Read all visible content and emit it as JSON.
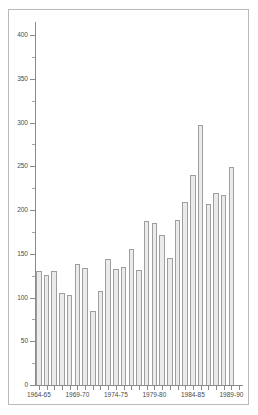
{
  "figure": {
    "background_color": "#ffffff",
    "frame_color": "#b9b9b9",
    "axis_color": "#8a8a8a",
    "bar_fill_color": "#ebebeb",
    "bar_edge_color": "#9e9e9e"
  },
  "chart_data": {
    "type": "bar",
    "title": "",
    "subtitle": "",
    "xlabel": "",
    "ylabel": "",
    "ylim": [
      0,
      415
    ],
    "grid": false,
    "legend": null,
    "y_major_ticks": [
      0,
      50,
      100,
      150,
      200,
      250,
      300,
      350,
      400
    ],
    "y_tick_labels": [
      "0",
      "50",
      "100",
      "150",
      "200",
      "250",
      "300",
      "350",
      "400"
    ],
    "y_minor_tick_interval": 25,
    "x_tick_labels": [
      "1964-65",
      "1969-70",
      "1974-75",
      "1979-80",
      "1984-85",
      "1989-90"
    ],
    "x_tick_label_indices": [
      0,
      5,
      10,
      15,
      20,
      25
    ],
    "categories": [
      "1964-65",
      "1965-66",
      "1966-67",
      "1967-68",
      "1968-69",
      "1969-70",
      "1970-71",
      "1971-72",
      "1972-73",
      "1973-74",
      "1974-75",
      "1975-76",
      "1976-77",
      "1977-78",
      "1978-79",
      "1979-80",
      "1980-81",
      "1981-82",
      "1982-83",
      "1983-84",
      "1984-85",
      "1985-86",
      "1986-87",
      "1987-88",
      "1988-89",
      "1989-90",
      "1990-91"
    ],
    "values": [
      130,
      126,
      130,
      105,
      103,
      138,
      134,
      85,
      108,
      144,
      133,
      135,
      156,
      132,
      187,
      185,
      172,
      145,
      189,
      209,
      240,
      297,
      207,
      219,
      217,
      249,
      0
    ]
  }
}
